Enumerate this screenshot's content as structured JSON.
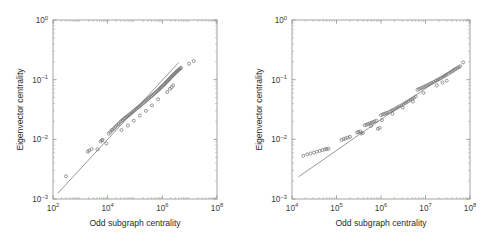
{
  "figure": {
    "background_color": "#ffffff",
    "marker_color": "#6f6f6f",
    "line_color": "#8c8c8c",
    "axis_color": "#9a9a9a"
  },
  "chart_data": [
    {
      "type": "scatter",
      "panel": "left",
      "title": "",
      "xlabel": "Odd subgraph centrality",
      "ylabel": "Eigenvector centrality",
      "xscale": "log",
      "yscale": "log",
      "xlim": [
        100,
        100000000
      ],
      "ylim": [
        0.001,
        1
      ],
      "xticks": [
        100,
        10000,
        1000000,
        100000000
      ],
      "xticklabels": [
        "10^2",
        "10^4",
        "10^6",
        "10^8"
      ],
      "yticks": [
        0.001,
        0.01,
        0.1,
        1
      ],
      "yticklabels": [
        "10^-3",
        "10^-2",
        "10^-1",
        "10^0"
      ],
      "grid": false,
      "legend": null,
      "minor_ticks": true,
      "reference_line": {
        "x": [
          150,
          4000000
        ],
        "y": [
          0.00125,
          0.195
        ],
        "style": "solid"
      },
      "points": [
        [
          300,
          0.0024
        ],
        [
          1900,
          0.0062
        ],
        [
          2100,
          0.0065
        ],
        [
          2600,
          0.0069
        ],
        [
          5500,
          0.0092
        ],
        [
          6200,
          0.0096
        ],
        [
          6500,
          0.0098
        ],
        [
          11000,
          0.0125
        ],
        [
          12500,
          0.0133
        ],
        [
          14000,
          0.0142
        ],
        [
          15000,
          0.0145
        ],
        [
          17000,
          0.0152
        ],
        [
          19000,
          0.0161
        ],
        [
          21000,
          0.017
        ],
        [
          24000,
          0.0178
        ],
        [
          26000,
          0.0185
        ],
        [
          30000,
          0.0198
        ],
        [
          33000,
          0.0205
        ],
        [
          36000,
          0.0211
        ],
        [
          40000,
          0.0223
        ],
        [
          44000,
          0.023
        ],
        [
          48000,
          0.0238
        ],
        [
          52000,
          0.0244
        ],
        [
          58000,
          0.0252
        ],
        [
          63000,
          0.0262
        ],
        [
          70000,
          0.027
        ],
        [
          78000,
          0.0283
        ],
        [
          86000,
          0.0293
        ],
        [
          95000,
          0.0305
        ],
        [
          105000,
          0.0318
        ],
        [
          115000,
          0.0328
        ],
        [
          128000,
          0.0341
        ],
        [
          140000,
          0.0352
        ],
        [
          155000,
          0.0366
        ],
        [
          170000,
          0.038
        ],
        [
          190000,
          0.0396
        ],
        [
          210000,
          0.0412
        ],
        [
          230000,
          0.0427
        ],
        [
          255000,
          0.0445
        ],
        [
          280000,
          0.0462
        ],
        [
          310000,
          0.0482
        ],
        [
          340000,
          0.0498
        ],
        [
          375000,
          0.0518
        ],
        [
          410000,
          0.0536
        ],
        [
          450000,
          0.0556
        ],
        [
          490000,
          0.0575
        ],
        [
          540000,
          0.0598
        ],
        [
          590000,
          0.062
        ],
        [
          640000,
          0.064
        ],
        [
          700000,
          0.0665
        ],
        [
          760000,
          0.069
        ],
        [
          820000,
          0.0712
        ],
        [
          880000,
          0.0735
        ],
        [
          950000,
          0.076
        ],
        [
          1020000,
          0.0785
        ],
        [
          1100000,
          0.0812
        ],
        [
          1180000,
          0.0838
        ],
        [
          1260000,
          0.0865
        ],
        [
          1350000,
          0.0892
        ],
        [
          1440000,
          0.092
        ],
        [
          1540000,
          0.095
        ],
        [
          1650000,
          0.0982
        ],
        [
          1760000,
          0.1012
        ],
        [
          1880000,
          0.1045
        ],
        [
          2000000,
          0.1078
        ],
        [
          2150000,
          0.1115
        ],
        [
          2300000,
          0.115
        ],
        [
          2450000,
          0.1185
        ],
        [
          2600000,
          0.1218
        ],
        [
          2800000,
          0.1258
        ],
        [
          3000000,
          0.1298
        ],
        [
          3200000,
          0.1335
        ],
        [
          3400000,
          0.137
        ],
        [
          3650000,
          0.1412
        ],
        [
          3900000,
          0.1452
        ],
        [
          4200000,
          0.1498
        ],
        [
          4500000,
          0.154
        ],
        [
          4800000,
          0.158
        ],
        [
          1900000,
          0.07
        ],
        [
          2200000,
          0.075
        ],
        [
          2500000,
          0.08
        ],
        [
          1500000,
          0.062
        ],
        [
          700000,
          0.047
        ],
        [
          420000,
          0.037
        ],
        [
          250000,
          0.03
        ],
        [
          150000,
          0.025
        ],
        [
          90000,
          0.0205
        ],
        [
          55000,
          0.017
        ],
        [
          32000,
          0.0143
        ],
        [
          9000,
          0.0085
        ],
        [
          4200,
          0.0068
        ],
        [
          14000000,
          0.205
        ],
        [
          9500000,
          0.185
        ]
      ]
    },
    {
      "type": "scatter",
      "panel": "right",
      "title": "",
      "xlabel": "Odd subgraph centrality",
      "ylabel": "Eigenvector centrality",
      "xscale": "log",
      "yscale": "log",
      "xlim": [
        10000,
        100000000
      ],
      "ylim": [
        0.001,
        1
      ],
      "xticks": [
        10000,
        100000,
        1000000,
        10000000,
        100000000
      ],
      "xticklabels": [
        "10^4",
        "10^5",
        "10^6",
        "10^7",
        "10^8"
      ],
      "yticks": [
        0.001,
        0.01,
        0.1,
        1
      ],
      "yticklabels": [
        "10^-3",
        "10^-2",
        "10^-1",
        "10^0"
      ],
      "grid": false,
      "legend": null,
      "minor_ticks": true,
      "reference_line": {
        "x": [
          14000,
          45000000
        ],
        "y": [
          0.00235,
          0.155
        ],
        "style": "solid"
      },
      "points": [
        [
          18000,
          0.0053
        ],
        [
          22000,
          0.0056
        ],
        [
          26000,
          0.0058
        ],
        [
          31000,
          0.006
        ],
        [
          36000,
          0.0062
        ],
        [
          42000,
          0.0064
        ],
        [
          48000,
          0.0066
        ],
        [
          55000,
          0.0068
        ],
        [
          60000,
          0.0069
        ],
        [
          66000,
          0.007
        ],
        [
          130000,
          0.0098
        ],
        [
          145000,
          0.0101
        ],
        [
          160000,
          0.0104
        ],
        [
          180000,
          0.0107
        ],
        [
          200000,
          0.011
        ],
        [
          290000,
          0.013
        ],
        [
          310000,
          0.0133
        ],
        [
          340000,
          0.0136
        ],
        [
          360000,
          0.0125
        ],
        [
          390000,
          0.0128
        ],
        [
          430000,
          0.0172
        ],
        [
          470000,
          0.0176
        ],
        [
          510000,
          0.018
        ],
        [
          560000,
          0.0185
        ],
        [
          610000,
          0.019
        ],
        [
          660000,
          0.0195
        ],
        [
          720000,
          0.02
        ],
        [
          790000,
          0.0206
        ],
        [
          850000,
          0.015
        ],
        [
          930000,
          0.0155
        ],
        [
          1000000,
          0.0255
        ],
        [
          1100000,
          0.0262
        ],
        [
          1200000,
          0.0268
        ],
        [
          1300000,
          0.0275
        ],
        [
          1400000,
          0.028
        ],
        [
          1550000,
          0.029
        ],
        [
          1700000,
          0.03
        ],
        [
          1850000,
          0.031
        ],
        [
          2000000,
          0.032
        ],
        [
          2200000,
          0.0332
        ],
        [
          2400000,
          0.0345
        ],
        [
          2600000,
          0.0358
        ],
        [
          2900000,
          0.0372
        ],
        [
          3200000,
          0.039
        ],
        [
          3500000,
          0.0405
        ],
        [
          3800000,
          0.042
        ],
        [
          4200000,
          0.044
        ],
        [
          4600000,
          0.0458
        ],
        [
          5000000,
          0.0475
        ],
        [
          5500000,
          0.0498
        ],
        [
          6000000,
          0.052
        ],
        [
          6600000,
          0.068
        ],
        [
          7200000,
          0.07
        ],
        [
          7900000,
          0.072
        ],
        [
          8600000,
          0.074
        ],
        [
          9400000,
          0.0762
        ],
        [
          10200000,
          0.0785
        ],
        [
          11000000,
          0.0808
        ],
        [
          12000000,
          0.0835
        ],
        [
          13000000,
          0.086
        ],
        [
          14000000,
          0.0885
        ],
        [
          15500000,
          0.092
        ],
        [
          17000000,
          0.0955
        ],
        [
          18500000,
          0.099
        ],
        [
          20000000,
          0.102
        ],
        [
          22000000,
          0.106
        ],
        [
          24000000,
          0.11
        ],
        [
          26000000,
          0.114
        ],
        [
          28000000,
          0.118
        ],
        [
          30000000,
          0.122
        ],
        [
          33000000,
          0.127
        ],
        [
          36000000,
          0.132
        ],
        [
          39000000,
          0.137
        ],
        [
          42000000,
          0.142
        ],
        [
          45000000,
          0.147
        ],
        [
          48000000,
          0.152
        ],
        [
          52000000,
          0.157
        ],
        [
          56000000,
          0.162
        ],
        [
          60000000,
          0.168
        ],
        [
          24000000,
          0.09
        ],
        [
          30000000,
          0.096
        ],
        [
          18000000,
          0.08
        ],
        [
          9000000,
          0.06
        ],
        [
          5200000,
          0.043
        ],
        [
          3100000,
          0.034
        ],
        [
          1800000,
          0.0268
        ],
        [
          1050000,
          0.021
        ],
        [
          600000,
          0.0168
        ],
        [
          70000000,
          0.195
        ]
      ]
    }
  ]
}
